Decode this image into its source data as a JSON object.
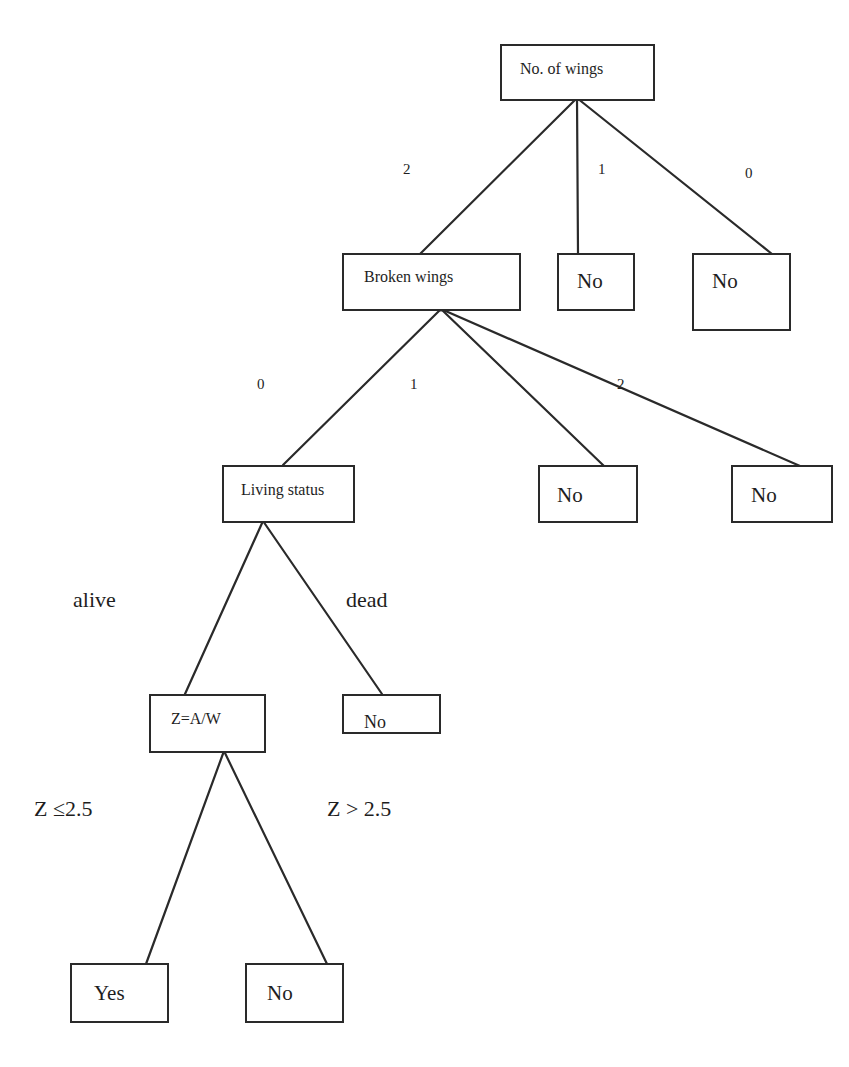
{
  "diagram": {
    "type": "decision-tree",
    "nodes": {
      "root": {
        "label": "No. of wings"
      },
      "broken_wings": {
        "label": "Broken wings"
      },
      "wings1_leaf": {
        "label": "No"
      },
      "wings0_leaf": {
        "label": "No"
      },
      "living_status": {
        "label": "Living status"
      },
      "broken1_leaf": {
        "label": "No"
      },
      "broken2_leaf": {
        "label": "No"
      },
      "z_ratio": {
        "label": "Z=A/W"
      },
      "dead_leaf": {
        "label": "No"
      },
      "yes_leaf": {
        "label": "Yes"
      },
      "z_high_leaf": {
        "label": "No"
      }
    },
    "edges": {
      "root_to_broken": {
        "label": "2"
      },
      "root_to_wings1": {
        "label": "1"
      },
      "root_to_wings0": {
        "label": "0"
      },
      "broken_to_living": {
        "label": "0"
      },
      "broken_to_no1": {
        "label": "1"
      },
      "broken_to_no2": {
        "label": "2"
      },
      "living_to_z": {
        "label": "alive"
      },
      "living_to_dead": {
        "label": "dead"
      },
      "z_to_yes": {
        "label": "Z ≤2.5"
      },
      "z_to_no": {
        "label": "Z > 2.5"
      }
    }
  }
}
